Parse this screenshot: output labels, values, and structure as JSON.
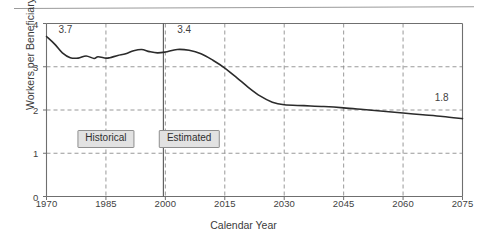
{
  "figure": {
    "name": "workers-per-beneficiary-chart",
    "divider_rule": "top-horizontal-rule"
  },
  "chart_data": {
    "type": "line",
    "title": "",
    "xlabel": "Calendar Year",
    "ylabel": "Workers per Beneficiary",
    "xlim": [
      1970,
      2075
    ],
    "ylim": [
      0,
      4
    ],
    "grid": true,
    "legend": "none",
    "x_ticks": [
      1970,
      1985,
      2000,
      2015,
      2030,
      2045,
      2060,
      2075
    ],
    "y_ticks": [
      0,
      1,
      2,
      3,
      4
    ],
    "series": [
      {
        "name": "Workers per Beneficiary",
        "color": "#2b2b2b",
        "x": [
          1970,
          1972,
          1974,
          1976,
          1978,
          1980,
          1982,
          1983,
          1985,
          1986,
          1988,
          1990,
          1992,
          1994,
          1996,
          1998,
          2000,
          2003,
          2006,
          2009,
          2012,
          2015,
          2018,
          2021,
          2024,
          2027,
          2030,
          2035,
          2040,
          2045,
          2050,
          2055,
          2060,
          2065,
          2070,
          2075
        ],
        "y": [
          3.7,
          3.53,
          3.32,
          3.21,
          3.2,
          3.25,
          3.19,
          3.23,
          3.2,
          3.21,
          3.26,
          3.3,
          3.37,
          3.4,
          3.35,
          3.32,
          3.34,
          3.4,
          3.38,
          3.3,
          3.15,
          2.97,
          2.75,
          2.52,
          2.32,
          2.18,
          2.12,
          2.1,
          2.08,
          2.05,
          2.01,
          1.97,
          1.93,
          1.89,
          1.85,
          1.8
        ]
      }
    ],
    "annotations": [
      {
        "name": "value-label-start",
        "text": "3.7",
        "x": 1973,
        "y": 3.84
      },
      {
        "name": "value-label-2000",
        "text": "3.4",
        "x": 2003,
        "y": 3.84
      },
      {
        "name": "value-label-end",
        "text": "1.8",
        "x": 2068,
        "y": 2.27
      }
    ],
    "period_markers": [
      {
        "name": "period-historical",
        "label": "Historical",
        "x": 1985
      },
      {
        "name": "period-estimated",
        "label": "Estimated",
        "x": 2006
      }
    ],
    "divider_line": {
      "name": "historical-estimated-divider",
      "x": 1999.5
    }
  }
}
